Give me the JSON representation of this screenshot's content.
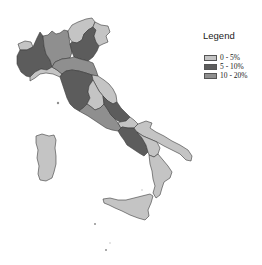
{
  "legend": {
    "title": "Legend",
    "items": [
      {
        "label": "0 - 5%",
        "color": "#c4c4c4"
      },
      {
        "label": "5 - 10%",
        "color": "#5c5c5c"
      },
      {
        "label": "10 - 20%",
        "color": "#8f8f8f"
      }
    ]
  },
  "map": {
    "regions": [
      {
        "name": "Valle d'Aosta",
        "class": "0 - 5%"
      },
      {
        "name": "Piemonte",
        "class": "5 - 10%"
      },
      {
        "name": "Liguria",
        "class": "0 - 5%"
      },
      {
        "name": "Lombardia",
        "class": "10 - 20%"
      },
      {
        "name": "Trentino-Alto Adige",
        "class": "0 - 5%"
      },
      {
        "name": "Veneto",
        "class": "5 - 10%"
      },
      {
        "name": "Friuli-Venezia Giulia",
        "class": "0 - 5%"
      },
      {
        "name": "Emilia-Romagna",
        "class": "10 - 20%"
      },
      {
        "name": "Toscana",
        "class": "5 - 10%"
      },
      {
        "name": "Marche",
        "class": "0 - 5%"
      },
      {
        "name": "Umbria",
        "class": "0 - 5%"
      },
      {
        "name": "Lazio",
        "class": "10 - 20%"
      },
      {
        "name": "Abruzzo",
        "class": "5 - 10%"
      },
      {
        "name": "Molise",
        "class": "0 - 5%"
      },
      {
        "name": "Campania",
        "class": "5 - 10%"
      },
      {
        "name": "Puglia",
        "class": "0 - 5%"
      },
      {
        "name": "Basilicata",
        "class": "0 - 5%"
      },
      {
        "name": "Calabria",
        "class": "0 - 5%"
      },
      {
        "name": "Sicilia",
        "class": "0 - 5%"
      },
      {
        "name": "Sardegna",
        "class": "0 - 5%"
      }
    ]
  }
}
